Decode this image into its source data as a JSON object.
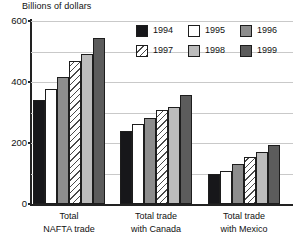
{
  "chart_data": {
    "type": "bar",
    "title": "Billions of dollars",
    "xlabel": "",
    "ylabel": "Billions of dollars",
    "ylim": [
      0,
      600
    ],
    "yticks": [
      0,
      200,
      400,
      600
    ],
    "ytick_labels": [
      "0",
      "200",
      "400",
      "600"
    ],
    "gridlines": [
      0,
      100,
      200,
      300,
      400,
      500,
      600
    ],
    "grid": true,
    "legend_position": "top-right",
    "categories": [
      "Total NAFTA trade",
      "Total trade with Canada",
      "Total trade with Mexico"
    ],
    "category_lines": [
      [
        "Total",
        "NAFTA trade"
      ],
      [
        "Total trade",
        "with Canada"
      ],
      [
        "Total trade",
        "with Mexico"
      ]
    ],
    "series": [
      {
        "name": "1994",
        "color": "#17171a",
        "pattern": "solid",
        "values": [
          341,
          240,
          100
        ]
      },
      {
        "name": "1995",
        "color": "#ffffff",
        "pattern": "solid",
        "values": [
          377,
          262,
          107
        ]
      },
      {
        "name": "1996",
        "color": "#8d8d8d",
        "pattern": "solid",
        "values": [
          416,
          282,
          131
        ]
      },
      {
        "name": "1997",
        "color": "#ffffff",
        "pattern": "diagonal-hatch",
        "values": [
          469,
          308,
          154
        ]
      },
      {
        "name": "1998",
        "color": "#bcbcbc",
        "pattern": "solid",
        "values": [
          492,
          318,
          170
        ]
      },
      {
        "name": "1999",
        "color": "#5c5c5c",
        "pattern": "solid",
        "values": [
          544,
          357,
          193
        ]
      }
    ]
  },
  "legend": {
    "rows": [
      [
        {
          "label": "1994",
          "key": "1994"
        },
        {
          "label": "1995",
          "key": "1995"
        },
        {
          "label": "1996",
          "key": "1996"
        }
      ],
      [
        {
          "label": "1997",
          "key": "1997"
        },
        {
          "label": "1998",
          "key": "1998"
        },
        {
          "label": "1999",
          "key": "1999"
        }
      ]
    ]
  }
}
